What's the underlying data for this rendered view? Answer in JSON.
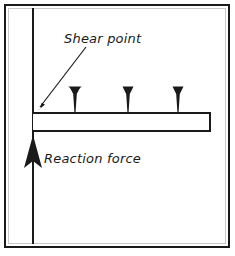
{
  "figure": {
    "background_color": "#ffffff",
    "ink_color": "#1a1a1a",
    "border": {
      "name": "figure-border",
      "x": 4,
      "y": 4,
      "width": 225,
      "height": 243,
      "stroke_width": 2
    }
  },
  "labels": {
    "shear_point": "Shear point",
    "reaction_force": "Reaction force"
  },
  "structure": {
    "column": {
      "label": "vertical column",
      "x": 33,
      "y_top": 8,
      "y_bottom": 244,
      "stroke_width": 2
    },
    "beam": {
      "label": "cantilever beam",
      "x_left": 33,
      "x_right": 210,
      "y_top": 113,
      "y_bottom": 131,
      "stroke_width": 2
    }
  },
  "loads": {
    "label": "distributed point loads",
    "direction": "down",
    "count": 3,
    "positions_x": [
      75,
      128,
      178
    ],
    "tip_y": 112,
    "top_y": 86
  },
  "reaction": {
    "label": "reaction force arrow",
    "direction": "up",
    "x": 33,
    "tip_y": 135,
    "tail_y": 205,
    "head_base_y": 168,
    "head_half_width": 9
  },
  "leader": {
    "label": "shear point leader line",
    "from_x": 86,
    "from_y": 47,
    "to_x": 37,
    "to_y": 110,
    "stroke_width": 1
  },
  "label_positions": {
    "shear_point": {
      "x": 64,
      "y": 43
    },
    "reaction_force": {
      "x": 44,
      "y": 163
    }
  }
}
